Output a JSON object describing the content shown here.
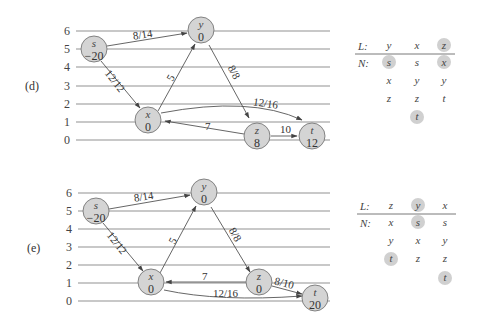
{
  "figure": {
    "panels": [
      {
        "id": "d",
        "label": "(d)",
        "ticks": [
          "0",
          "1",
          "2",
          "3",
          "4",
          "5",
          "6"
        ],
        "nodes": {
          "s": {
            "name": "s",
            "value": "−20"
          },
          "y": {
            "name": "y",
            "value": "0"
          },
          "x": {
            "name": "x",
            "value": "0"
          },
          "z": {
            "name": "z",
            "value": "8"
          },
          "t": {
            "name": "t",
            "value": "12"
          }
        },
        "edges": {
          "sy": "8/14",
          "sx": "12/12",
          "xy": "5",
          "yz": "8/8",
          "xt": "12/16",
          "zx": "7",
          "zt": "10"
        },
        "table": {
          "L_label": "L:",
          "N_label": "N:",
          "L": [
            "y",
            "x",
            "z"
          ],
          "L_highlight": [
            false,
            false,
            true
          ],
          "N": [
            [
              "s",
              "x",
              "z"
            ],
            [
              "s",
              "y",
              "z",
              "t"
            ],
            [
              "x",
              "y",
              "t"
            ]
          ],
          "N_highlight": [
            [
              true,
              false,
              false
            ],
            [
              false,
              false,
              false,
              true
            ],
            [
              true,
              false,
              false
            ]
          ]
        }
      },
      {
        "id": "e",
        "label": "(e)",
        "ticks": [
          "0",
          "1",
          "2",
          "3",
          "4",
          "5",
          "6"
        ],
        "nodes": {
          "s": {
            "name": "s",
            "value": "−20"
          },
          "y": {
            "name": "y",
            "value": "0"
          },
          "x": {
            "name": "x",
            "value": "0"
          },
          "z": {
            "name": "z",
            "value": "0"
          },
          "t": {
            "name": "t",
            "value": "20"
          }
        },
        "edges": {
          "sy": "8/14",
          "sx": "12/12",
          "xy": "5",
          "yz": "8/8",
          "zx": "7",
          "xt": "12/16",
          "zt": "8/10"
        },
        "table": {
          "L_label": "L:",
          "N_label": "N:",
          "L": [
            "z",
            "y",
            "x"
          ],
          "L_highlight": [
            false,
            true,
            false
          ],
          "N": [
            [
              "x",
              "y",
              "t"
            ],
            [
              "s",
              "x",
              "z"
            ],
            [
              "s",
              "y",
              "z",
              "t"
            ]
          ],
          "N_highlight": [
            [
              false,
              false,
              true
            ],
            [
              true,
              false,
              false
            ],
            [
              false,
              false,
              false,
              true
            ]
          ]
        }
      }
    ],
    "colors": {
      "node_fill": "#d4d4d4",
      "grid": "#c8c8c8",
      "highlight": "#d0d0d0"
    }
  }
}
